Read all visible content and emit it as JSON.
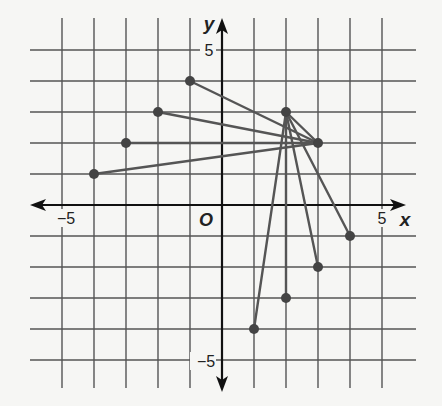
{
  "graph": {
    "x_axis_label": "x",
    "y_axis_label": "y",
    "origin_label": "O",
    "x_ticks": [
      {
        "value": -5,
        "label": "−5"
      },
      {
        "value": 5,
        "label": "5"
      }
    ],
    "y_ticks": [
      {
        "value": 5,
        "label": "5"
      },
      {
        "value": -5,
        "label": "−5"
      }
    ],
    "grid_range": {
      "xmin": -5,
      "xmax": 5,
      "ymin": -5,
      "ymax": 5
    },
    "colors": {
      "grid": "#555555",
      "axis": "#111111",
      "segment": "#555555",
      "point": "#444444",
      "background": "#f6f6f4"
    }
  },
  "chart_data": {
    "type": "scatter",
    "title": "",
    "xlabel": "x",
    "ylabel": "y",
    "xlim": [
      -6,
      6
    ],
    "ylim": [
      -6,
      6
    ],
    "grid": true,
    "hubs": [
      {
        "name": "A",
        "x": 2,
        "y": 3
      },
      {
        "name": "B",
        "x": 3,
        "y": 2
      }
    ],
    "points": [
      {
        "x": -1,
        "y": 4,
        "connects_to": "B"
      },
      {
        "x": -2,
        "y": 3,
        "connects_to": "B"
      },
      {
        "x": -3,
        "y": 2,
        "connects_to": "B"
      },
      {
        "x": -4,
        "y": 1,
        "connects_to": "B"
      },
      {
        "x": 4,
        "y": -1,
        "connects_to": "A"
      },
      {
        "x": 3,
        "y": -2,
        "connects_to": "A"
      },
      {
        "x": 2,
        "y": -3,
        "connects_to": "A"
      },
      {
        "x": 1,
        "y": -4,
        "connects_to": "A"
      }
    ],
    "segments": [
      {
        "from": [
          2,
          3
        ],
        "to": [
          3,
          2
        ]
      },
      {
        "from": [
          -1,
          4
        ],
        "to": [
          3,
          2
        ]
      },
      {
        "from": [
          -2,
          3
        ],
        "to": [
          3,
          2
        ]
      },
      {
        "from": [
          -3,
          2
        ],
        "to": [
          3,
          2
        ]
      },
      {
        "from": [
          -4,
          1
        ],
        "to": [
          3,
          2
        ]
      },
      {
        "from": [
          4,
          -1
        ],
        "to": [
          2,
          3
        ]
      },
      {
        "from": [
          3,
          -2
        ],
        "to": [
          2,
          3
        ]
      },
      {
        "from": [
          2,
          -3
        ],
        "to": [
          2,
          3
        ]
      },
      {
        "from": [
          1,
          -4
        ],
        "to": [
          2,
          3
        ]
      }
    ]
  }
}
